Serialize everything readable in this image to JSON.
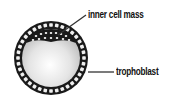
{
  "diagram": {
    "labels": {
      "inner_cell_mass": "inner cell mass",
      "trophoblast": "trophoblast"
    },
    "colors": {
      "ring": "#1a1a1a",
      "cell": "#f2f2f2",
      "cavity_center": "#ffffff",
      "cavity_edge": "#c8c8c8",
      "leader_line": "#333333"
    }
  }
}
